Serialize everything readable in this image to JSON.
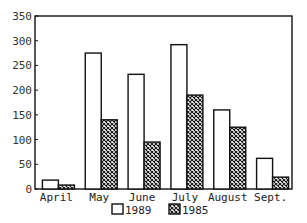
{
  "chart_data": {
    "type": "bar",
    "title": "",
    "xlabel": "",
    "ylabel": "",
    "categories": [
      "April",
      "May",
      "June",
      "July",
      "August",
      "Sept."
    ],
    "series": [
      {
        "name": "1989",
        "pattern": "plain",
        "values": [
          18,
          275,
          232,
          292,
          160,
          62
        ]
      },
      {
        "name": "1985",
        "pattern": "crosshatch",
        "values": [
          8,
          140,
          95,
          190,
          125,
          24
        ]
      }
    ],
    "ylim": [
      0,
      350
    ],
    "yticks": [
      0,
      50,
      100,
      150,
      200,
      250,
      300,
      350
    ],
    "grid": false,
    "legend_position": "bottom-center"
  },
  "colors": {
    "stroke": "#111111",
    "fill_plain": "#ffffff",
    "hatch": "#111111",
    "background": "#ffffff"
  },
  "legend": {
    "items": [
      {
        "label": "1989",
        "pattern": "plain"
      },
      {
        "label": "1985",
        "pattern": "crosshatch"
      }
    ]
  }
}
